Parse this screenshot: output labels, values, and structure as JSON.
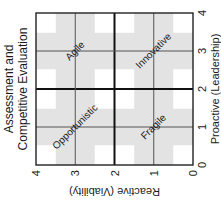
{
  "chart_data": {
    "type": "quadrant",
    "title": [
      "Assessment and",
      "Competitive Evaluation"
    ],
    "xlabel": "Proactive (Leadership)",
    "ylabel": "Reactive (Viability)",
    "xlim": [
      0,
      4
    ],
    "ylim": [
      0,
      4
    ],
    "xticks": [
      "0",
      "1",
      "2",
      "3",
      "4"
    ],
    "yticks": [
      "0",
      "1",
      "2",
      "3",
      "4"
    ],
    "grid": true,
    "quadrant_dividers": {
      "x": 2,
      "y": 2
    },
    "quadrants": [
      {
        "label": "Fragile",
        "x_range": [
          0,
          2
        ],
        "y_range": [
          0,
          2
        ]
      },
      {
        "label": "Innovative",
        "x_range": [
          2,
          4
        ],
        "y_range": [
          0,
          2
        ]
      },
      {
        "label": "Opportunistic",
        "x_range": [
          0,
          2
        ],
        "y_range": [
          2,
          4
        ]
      },
      {
        "label": "Agile",
        "x_range": [
          2,
          4
        ],
        "y_range": [
          2,
          4
        ]
      }
    ],
    "rotation_deg": -90
  },
  "colors": {
    "cross_fill": "#e3e3e3",
    "corner_fill": "#ffffff",
    "grid_line": "#555555",
    "divider_line": "#111111",
    "frame": "#222222"
  }
}
